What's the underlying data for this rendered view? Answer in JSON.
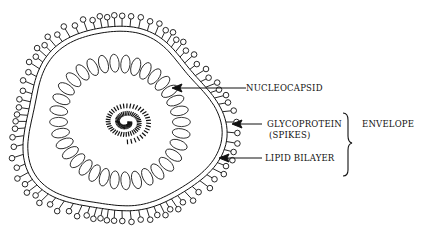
{
  "diagram": {
    "labels": {
      "nucleocapsid": "NUCLEOCAPSID",
      "glycoprotein": "GLYCOPROTEIN",
      "spikes": "(SPIKES)",
      "lipid_bilayer": "LIPID BILAYER",
      "envelope": "ENVELOPE"
    },
    "colors": {
      "ink": "#111111",
      "background": "#ffffff"
    },
    "components": [
      {
        "name": "nucleic acid genome",
        "shape": "coiled-hatched-core"
      },
      {
        "name": "nucleocapsid",
        "shape": "ring-of-ovals",
        "count": 34
      },
      {
        "name": "lipid bilayer",
        "shape": "double-line-membrane"
      },
      {
        "name": "glycoprotein spikes",
        "shape": "lollipop-projections"
      }
    ],
    "envelope_bracket_covers": [
      "glycoprotein",
      "lipid_bilayer"
    ]
  }
}
